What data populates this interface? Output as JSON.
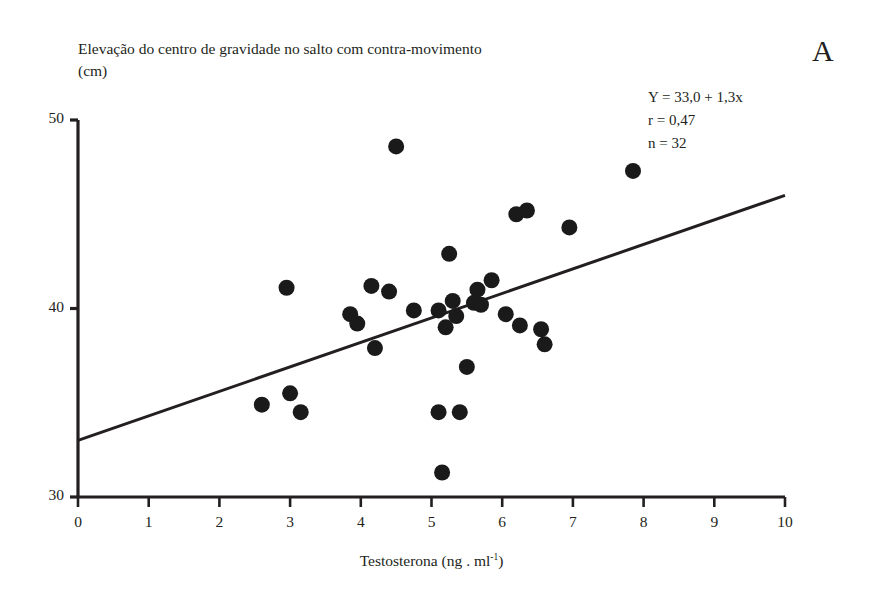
{
  "panel": {
    "letter": "A"
  },
  "axes": {
    "y_title": "Elevação do centro de gravidade no salto com contra-movimento\n(cm)",
    "x_title_main": "Testosterona (ng . ml",
    "x_title_sup": "-1",
    "x_title_close": ")",
    "x_title_full": "Testosterona (ng . ml-1)",
    "y_ticks": [
      "30",
      "40",
      "50"
    ],
    "x_ticks": [
      "0",
      "1",
      "2",
      "3",
      "4",
      "5",
      "6",
      "7",
      "8",
      "9",
      "10"
    ]
  },
  "stats": {
    "equation": "Y = 33,0 + 1,3x",
    "correlation": "r = 0,47",
    "sample_size": "n = 32"
  },
  "colors": {
    "axis": "#231f20",
    "marker": "#1a1a1a",
    "regression": "#231f20",
    "background": "#ffffff"
  },
  "chart_data": {
    "type": "scatter",
    "title": "",
    "xlabel": "Testosterona (ng . ml-1)",
    "ylabel": "Elevação do centro de gravidade no salto com contra-movimento (cm)",
    "xlim": [
      0,
      10
    ],
    "ylim": [
      30,
      50
    ],
    "xticks": [
      0,
      1,
      2,
      3,
      4,
      5,
      6,
      7,
      8,
      9,
      10
    ],
    "yticks": [
      30,
      40,
      50
    ],
    "grid": false,
    "legend": false,
    "n": 32,
    "r": 0.47,
    "regression": {
      "intercept": 33.0,
      "slope": 1.3,
      "label": "Y = 33,0 + 1,3x",
      "x_start": 0.0,
      "x_end": 10.0,
      "y_start": 33.0,
      "y_end": 46.0
    },
    "points": [
      {
        "x": 2.6,
        "y": 34.9
      },
      {
        "x": 2.95,
        "y": 41.1
      },
      {
        "x": 3.0,
        "y": 35.5
      },
      {
        "x": 3.15,
        "y": 34.5
      },
      {
        "x": 3.85,
        "y": 39.7
      },
      {
        "x": 3.95,
        "y": 39.2
      },
      {
        "x": 4.15,
        "y": 41.2
      },
      {
        "x": 4.2,
        "y": 37.9
      },
      {
        "x": 4.4,
        "y": 40.9
      },
      {
        "x": 4.5,
        "y": 48.6
      },
      {
        "x": 4.75,
        "y": 39.9
      },
      {
        "x": 5.1,
        "y": 39.9
      },
      {
        "x": 5.1,
        "y": 34.5
      },
      {
        "x": 5.15,
        "y": 31.3
      },
      {
        "x": 5.2,
        "y": 39.0
      },
      {
        "x": 5.25,
        "y": 42.9
      },
      {
        "x": 5.3,
        "y": 40.4
      },
      {
        "x": 5.35,
        "y": 39.6
      },
      {
        "x": 5.4,
        "y": 34.5
      },
      {
        "x": 5.5,
        "y": 36.9
      },
      {
        "x": 5.6,
        "y": 40.3
      },
      {
        "x": 5.65,
        "y": 41.0
      },
      {
        "x": 5.7,
        "y": 40.2
      },
      {
        "x": 5.85,
        "y": 41.5
      },
      {
        "x": 6.05,
        "y": 39.7
      },
      {
        "x": 6.2,
        "y": 45.0
      },
      {
        "x": 6.25,
        "y": 39.1
      },
      {
        "x": 6.35,
        "y": 45.2
      },
      {
        "x": 6.55,
        "y": 38.9
      },
      {
        "x": 6.6,
        "y": 38.1
      },
      {
        "x": 6.95,
        "y": 44.3
      },
      {
        "x": 7.85,
        "y": 47.3
      }
    ]
  },
  "geometry": {
    "plot_left": 78,
    "plot_right": 785,
    "plot_top": 120,
    "plot_bottom": 497,
    "marker_radius": 8
  }
}
